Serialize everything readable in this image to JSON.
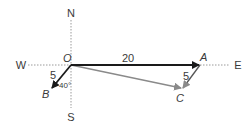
{
  "diagram": {
    "compass": {
      "north": "N",
      "south": "S",
      "west": "W",
      "east": "E"
    },
    "points": {
      "origin": "O",
      "a": "A",
      "b": "B",
      "c": "C"
    },
    "lengths": {
      "oa": "20",
      "ob": "5",
      "ac": "5"
    },
    "angle": "40°",
    "colors": {
      "main_vector": "#1a1a1a",
      "resultant": "#8a8a8a",
      "axis": "#9a9a9a"
    }
  }
}
